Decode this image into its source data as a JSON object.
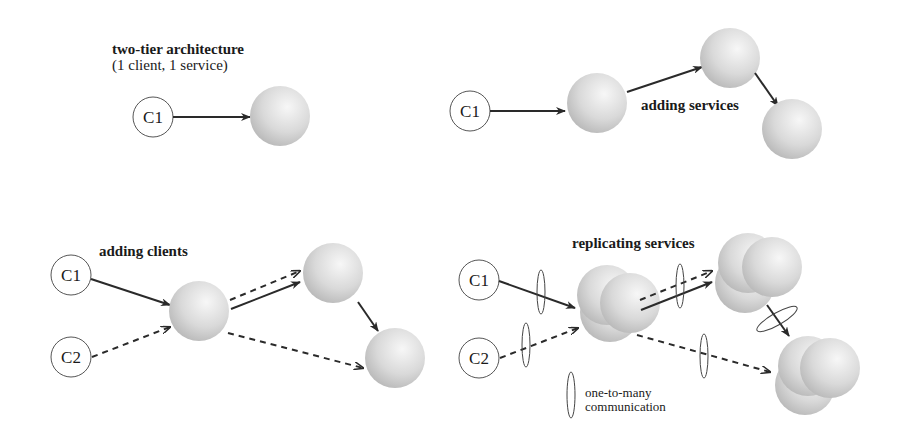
{
  "panels": {
    "two_tier": {
      "title": "two-tier architecture",
      "subtitle": "(1 client, 1 service)",
      "clients": [
        "C1"
      ]
    },
    "adding_services": {
      "title": "adding services",
      "clients": [
        "C1"
      ]
    },
    "adding_clients": {
      "title": "adding clients",
      "clients": [
        "C1",
        "C2"
      ]
    },
    "replicating_services": {
      "title": "replicating services",
      "clients": [
        "C1",
        "C2"
      ],
      "legend": {
        "line1": "one-to-many",
        "line2": "communication"
      }
    }
  },
  "colors": {
    "line": "#2a2a2a",
    "sphere_light": "#f4f4f4",
    "sphere_dark": "#b8b8b8",
    "client_stroke": "#555555"
  }
}
